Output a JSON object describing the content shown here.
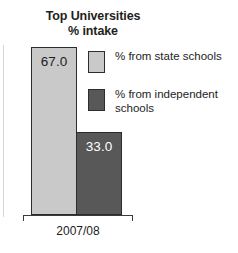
{
  "chart_data": {
    "type": "bar",
    "title": "Top Universities % intake",
    "title_line_1": "Top Universities",
    "title_line_2": "% intake",
    "categories": [
      "2007/08"
    ],
    "xlabel": "2007/08",
    "ylabel": "",
    "ylim": [
      0,
      67
    ],
    "grid": false,
    "legend_position": "right",
    "series": [
      {
        "name": "% from state schools",
        "values": [
          67.0
        ],
        "value_label": "67.0",
        "color": "#c9c9c9"
      },
      {
        "name": "% from independent schools",
        "values": [
          33.0
        ],
        "value_label": "33.0",
        "color": "#585858"
      }
    ]
  },
  "title": {
    "line_1": "Top Universities",
    "line_2": "% intake"
  },
  "bars": [
    {
      "label": "67.0",
      "series": "% from state schools"
    },
    {
      "label": "33.0",
      "series": "% from independent schools"
    }
  ],
  "legend": {
    "items": [
      {
        "label": "% from state schools",
        "swatch_color": "#c9c9c9"
      },
      {
        "label": "% from independent schools",
        "swatch_color": "#585858"
      }
    ]
  },
  "axis": {
    "category_label": "2007/08"
  },
  "colors": {
    "state": "#c9c9c9",
    "independent": "#585858",
    "bar_border": "#2c2c2c",
    "axis": "#3a3a3a",
    "text": "#1d1d1d",
    "title_text": "#231f20",
    "background": "#ffffff"
  }
}
